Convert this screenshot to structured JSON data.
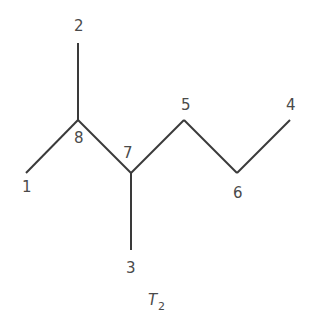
{
  "diagram": {
    "caption": {
      "main": "T",
      "subscript": "2"
    },
    "nodes": [
      {
        "id": "1",
        "label": "1",
        "x": 26,
        "y": 173,
        "lx": 22,
        "ly": 192
      },
      {
        "id": "2",
        "label": "2",
        "x": 78,
        "y": 43,
        "lx": 74,
        "ly": 31
      },
      {
        "id": "3",
        "label": "3",
        "x": 131,
        "y": 250,
        "lx": 126,
        "ly": 273
      },
      {
        "id": "4",
        "label": "4",
        "x": 290,
        "y": 120,
        "lx": 286,
        "ly": 110
      },
      {
        "id": "5",
        "label": "5",
        "x": 184,
        "y": 120,
        "lx": 181,
        "ly": 110
      },
      {
        "id": "6",
        "label": "6",
        "x": 237,
        "y": 173,
        "lx": 233,
        "ly": 198
      },
      {
        "id": "7",
        "label": "7",
        "x": 131,
        "y": 173,
        "lx": 123,
        "ly": 158
      },
      {
        "id": "8",
        "label": "8",
        "x": 78,
        "y": 120,
        "lx": 74,
        "ly": 143
      }
    ],
    "edges": [
      [
        "8",
        "2"
      ],
      [
        "8",
        "1"
      ],
      [
        "8",
        "7"
      ],
      [
        "7",
        "3"
      ],
      [
        "7",
        "5"
      ],
      [
        "5",
        "6"
      ],
      [
        "6",
        "4"
      ]
    ]
  }
}
